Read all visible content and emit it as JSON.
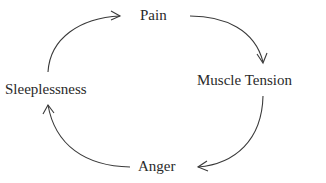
{
  "diagram": {
    "type": "cycle",
    "nodes": [
      {
        "id": "pain",
        "label": "Pain"
      },
      {
        "id": "muscle_tension",
        "label": "Muscle Tension"
      },
      {
        "id": "anger",
        "label": "Anger"
      },
      {
        "id": "sleeplessness",
        "label": "Sleeplessness"
      }
    ],
    "edges": [
      {
        "from": "Pain",
        "to": "Muscle Tension"
      },
      {
        "from": "Muscle Tension",
        "to": "Anger"
      },
      {
        "from": "Anger",
        "to": "Sleeplessness"
      },
      {
        "from": "Sleeplessness",
        "to": "Pain"
      }
    ],
    "colors": {
      "stroke": "#3a3a3a",
      "text": "#2a2a2a",
      "background": "#ffffff"
    }
  }
}
